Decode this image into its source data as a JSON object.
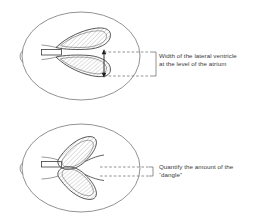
{
  "figure": {
    "title_alt": "Lateral ventricle measurement diagram",
    "colors": {
      "outline": "#6e6e6e",
      "structure": "#3c3c3c",
      "hatch": "#8a8a8a",
      "dashed": "#6e6e6e",
      "text": "#3a3a3a",
      "background": "#ffffff"
    },
    "panels": [
      {
        "id": "panel-top",
        "label_lines": [
          "Width of the lateral ventricle",
          "at the level of the atrium"
        ],
        "measurement": "width",
        "measurement_orientation": "vertical-double-arrow"
      },
      {
        "id": "panel-bottom",
        "label_lines": [
          "Quantify the amount of the",
          "“dangle”"
        ],
        "measurement": "dangle",
        "measurement_orientation": "horizontal-bracket"
      }
    ]
  },
  "labels": {
    "atrium_line1": "Width of the lateral ventricle",
    "atrium_line2": "at the level of the atrium",
    "dangle_line1": "Quantify the amount of the",
    "dangle_line2": "“dangle”"
  }
}
